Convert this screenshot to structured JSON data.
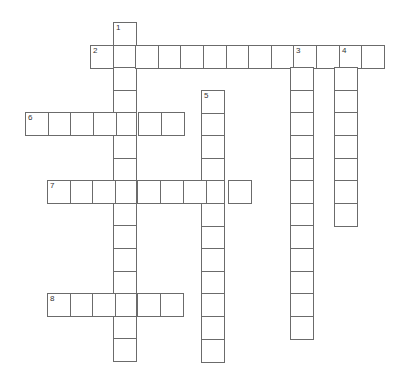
{
  "puzzle": {
    "cell_size": 22.6,
    "border_color": "#6b6b6b",
    "words": [
      {
        "number": "1",
        "direction": "down",
        "x": 113,
        "y": 22,
        "length": 15
      },
      {
        "number": "2",
        "direction": "across",
        "x": 90,
        "y": 44.5,
        "length": 13
      },
      {
        "number": "3",
        "direction": "down",
        "x": 290,
        "y": 44.5,
        "length": 13
      },
      {
        "number": "4",
        "direction": "down",
        "x": 334,
        "y": 44.5,
        "length": 8
      },
      {
        "number": "5",
        "direction": "down",
        "x": 201,
        "y": 90,
        "length": 12
      },
      {
        "number": "6",
        "direction": "across",
        "x": 25,
        "y": 112,
        "length": 7
      },
      {
        "number": "7",
        "direction": "across",
        "x": 47,
        "y": 180,
        "length": 9
      },
      {
        "number": "8",
        "direction": "across",
        "x": 47,
        "y": 293,
        "length": 6
      }
    ]
  }
}
